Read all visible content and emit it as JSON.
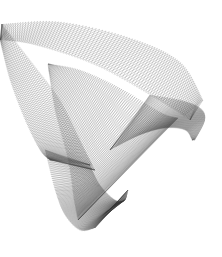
{
  "artwork": {
    "type": "string-art",
    "background": "#ffffff",
    "stroke": "#333333",
    "bands": [
      {
        "name": "outer-top-band",
        "a": [
          [
            2,
            24
          ],
          [
            60,
            22
          ],
          [
            130,
            38
          ],
          [
            180,
            62
          ],
          [
            203,
            100
          ]
        ],
        "b": [
          [
            0,
            40
          ],
          [
            35,
            45
          ],
          [
            95,
            65
          ],
          [
            150,
            95
          ],
          [
            190,
            120
          ]
        ]
      },
      {
        "name": "inner-dark-sheet",
        "a": [
          [
            48,
            64
          ],
          [
            80,
            70
          ],
          [
            120,
            88
          ],
          [
            160,
            112
          ],
          [
            178,
            118
          ]
        ],
        "b": [
          [
            48,
            64
          ],
          [
            55,
            110
          ],
          [
            68,
            160
          ],
          [
            74,
            200
          ],
          [
            78,
            220
          ]
        ]
      },
      {
        "name": "bottom-loop",
        "a": [
          [
            45,
            150
          ],
          [
            55,
            190
          ],
          [
            65,
            215
          ],
          [
            80,
            230
          ],
          [
            95,
            228
          ]
        ],
        "b": [
          [
            90,
            165
          ],
          [
            100,
            185
          ],
          [
            115,
            200
          ],
          [
            125,
            200
          ],
          [
            128,
            190
          ]
        ]
      },
      {
        "name": "right-lobe",
        "a": [
          [
            150,
            95
          ],
          [
            180,
            100
          ],
          [
            200,
            108
          ],
          [
            205,
            120
          ],
          [
            195,
            140
          ]
        ],
        "b": [
          [
            110,
            150
          ],
          [
            140,
            135
          ],
          [
            165,
            128
          ],
          [
            185,
            130
          ],
          [
            192,
            140
          ]
        ]
      },
      {
        "name": "left-fan",
        "a": [
          [
            0,
            40
          ],
          [
            10,
            80
          ],
          [
            25,
            120
          ],
          [
            40,
            150
          ],
          [
            50,
            160
          ]
        ],
        "b": [
          [
            2,
            24
          ],
          [
            30,
            60
          ],
          [
            60,
            100
          ],
          [
            80,
            140
          ],
          [
            95,
            170
          ]
        ]
      }
    ]
  }
}
